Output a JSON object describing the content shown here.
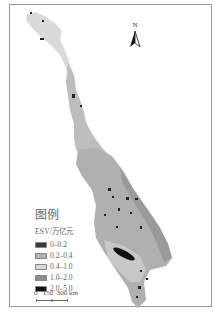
{
  "map": {
    "north_arrow": {
      "label": "N"
    },
    "legend": {
      "title": "图例",
      "subtitle": "ESV/万亿元",
      "items": [
        {
          "label": "0–0.2",
          "color": "#3a3a3a"
        },
        {
          "label": "0.2–0.4",
          "color": "#b4b4b4"
        },
        {
          "label": "0.4–1.0",
          "color": "#d8d8d8"
        },
        {
          "label": "1.0–2.0",
          "color": "#8e8e8e"
        },
        {
          "label": "2.0–5.0",
          "color": "#111111"
        }
      ]
    },
    "scale_bar": {
      "label": "0   150  300 km"
    }
  }
}
